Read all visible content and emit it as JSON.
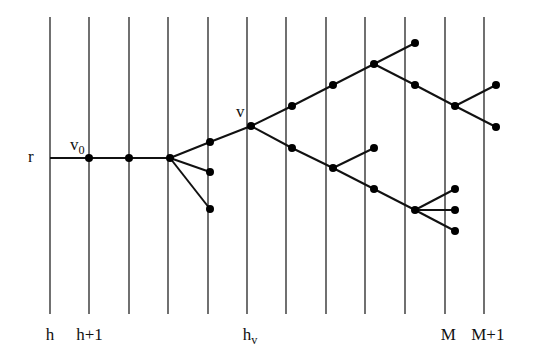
{
  "diagram": {
    "type": "tree-on-levels",
    "levels": {
      "x": [
        50,
        89,
        129,
        168,
        208,
        247,
        286,
        326,
        365,
        405,
        445,
        484
      ],
      "y_top": 17,
      "y_bottom": 314,
      "labels": [
        {
          "level_index": 0,
          "text": "h",
          "sub": ""
        },
        {
          "level_index": 1,
          "text": "h+1",
          "sub": ""
        },
        {
          "level_index": 5,
          "text": "h",
          "sub": "v"
        },
        {
          "level_index": 10,
          "text": "M",
          "sub": ""
        },
        {
          "level_index": 11,
          "text": "M+1",
          "sub": ""
        }
      ]
    },
    "nodes": [
      {
        "id": "v0",
        "x": 89,
        "y": 158
      },
      {
        "id": "n2",
        "x": 129,
        "y": 158
      },
      {
        "id": "n3",
        "x": 170,
        "y": 158
      },
      {
        "id": "n4a",
        "x": 210,
        "y": 142
      },
      {
        "id": "n4b",
        "x": 210,
        "y": 172
      },
      {
        "id": "n4c",
        "x": 210,
        "y": 209
      },
      {
        "id": "v",
        "x": 251,
        "y": 126
      },
      {
        "id": "u1",
        "x": 292,
        "y": 106
      },
      {
        "id": "u2",
        "x": 333,
        "y": 85
      },
      {
        "id": "u3",
        "x": 374,
        "y": 64
      },
      {
        "id": "u4a",
        "x": 415,
        "y": 43
      },
      {
        "id": "u4b",
        "x": 415,
        "y": 85
      },
      {
        "id": "u5",
        "x": 455,
        "y": 106
      },
      {
        "id": "u6a",
        "x": 496,
        "y": 85
      },
      {
        "id": "u6b",
        "x": 496,
        "y": 127
      },
      {
        "id": "d1",
        "x": 292,
        "y": 148
      },
      {
        "id": "d2",
        "x": 333,
        "y": 168
      },
      {
        "id": "d3a",
        "x": 374,
        "y": 148
      },
      {
        "id": "d3b",
        "x": 374,
        "y": 189
      },
      {
        "id": "d4",
        "x": 415,
        "y": 210
      },
      {
        "id": "d5a",
        "x": 455,
        "y": 189
      },
      {
        "id": "d5b",
        "x": 455,
        "y": 210
      },
      {
        "id": "d5c",
        "x": 455,
        "y": 231
      }
    ],
    "root_line": {
      "x1": 50,
      "y1": 158,
      "x2": 170,
      "y2": 158
    },
    "edges": [
      [
        "n3",
        "n4a"
      ],
      [
        "n3",
        "n4b"
      ],
      [
        "n3",
        "n4c"
      ],
      [
        "n4a",
        "v"
      ],
      [
        "v",
        "u1"
      ],
      [
        "u1",
        "u2"
      ],
      [
        "u2",
        "u3"
      ],
      [
        "u3",
        "u4a"
      ],
      [
        "u3",
        "u4b"
      ],
      [
        "u4b",
        "u5"
      ],
      [
        "u5",
        "u6a"
      ],
      [
        "u5",
        "u6b"
      ],
      [
        "v",
        "d1"
      ],
      [
        "d1",
        "d2"
      ],
      [
        "d2",
        "d3a"
      ],
      [
        "d2",
        "d3b"
      ],
      [
        "d3b",
        "d4"
      ],
      [
        "d4",
        "d5a"
      ],
      [
        "d4",
        "d5b"
      ],
      [
        "d4",
        "d5c"
      ]
    ],
    "node_labels": [
      {
        "text": "r",
        "sub": "",
        "x": 28,
        "y": 162
      },
      {
        "text": "v",
        "sub": "0",
        "x": 70,
        "y": 150
      },
      {
        "text": "v",
        "sub": "",
        "x": 236,
        "y": 117
      }
    ],
    "colors": {
      "line": "#111111",
      "node": "#000000"
    }
  }
}
